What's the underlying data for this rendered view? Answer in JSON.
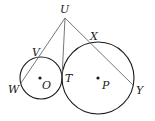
{
  "diagram": {
    "type": "geometry",
    "points": {
      "U": {
        "label": "U",
        "x": 65,
        "y": 18
      },
      "V": {
        "label": "V",
        "x": 38,
        "y": 58
      },
      "W": {
        "label": "W",
        "x": 21,
        "y": 83
      },
      "T": {
        "label": "T",
        "x": 62,
        "y": 78
      },
      "X": {
        "label": "X",
        "x": 91,
        "y": 43
      },
      "Y": {
        "label": "Y",
        "x": 134,
        "y": 86
      },
      "O": {
        "label": "O",
        "x": 41,
        "y": 78
      },
      "P": {
        "label": "P",
        "x": 98,
        "y": 78
      }
    },
    "circles": [
      {
        "name": "circle-O",
        "center": "O",
        "cx": 41,
        "cy": 78,
        "r": 21
      },
      {
        "name": "circle-P",
        "center": "P",
        "cx": 98,
        "cy": 78,
        "r": 36
      }
    ],
    "segments": [
      {
        "from": "U",
        "to": "W"
      },
      {
        "from": "U",
        "to": "T"
      },
      {
        "from": "U",
        "to": "Y"
      }
    ],
    "colors": {
      "stroke": "#1a1a1a",
      "line": "#666666"
    }
  }
}
